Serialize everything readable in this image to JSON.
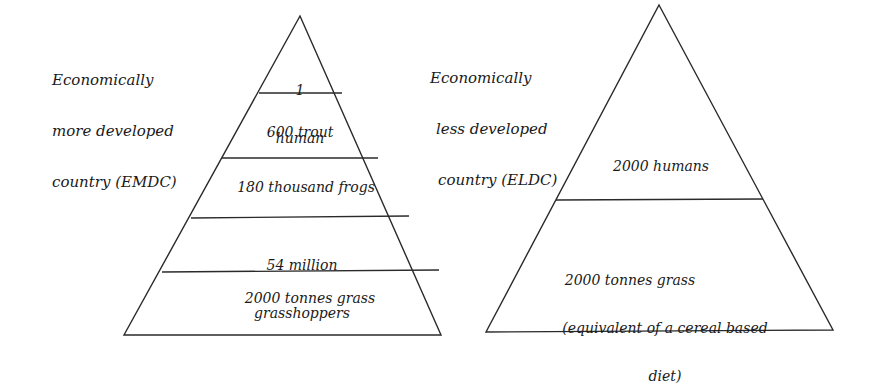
{
  "left_pyramid": {
    "title": [
      "Economically",
      "more developed",
      "country (EMDC)"
    ],
    "tiers": [
      {
        "line1": "1",
        "line2": "human"
      },
      {
        "line1": "600 trout"
      },
      {
        "line1": "180 thousand frogs"
      },
      {
        "line1": "54 million",
        "line2": "grasshoppers"
      },
      {
        "line1": "2000 tonnes grass"
      }
    ]
  },
  "right_pyramid": {
    "title": [
      "Economically",
      "less developed",
      "country (ELDC)"
    ],
    "tiers": [
      {
        "line1": "2000 humans"
      },
      {
        "line1": "2000 tonnes grass",
        "line2": "(equivalent of a cereal based",
        "line3": "diet)"
      }
    ]
  },
  "colors": {
    "line": "#2a2a2a",
    "background": "#ffffff"
  }
}
